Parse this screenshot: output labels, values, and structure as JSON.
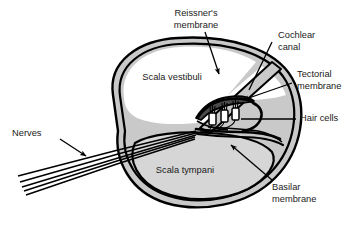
{
  "figure": {
    "width": 362,
    "height": 228,
    "background": "#ffffff"
  },
  "colors": {
    "outline": "#000000",
    "wall_fill": "#c9c9c9",
    "scala_tympani_fill": "#d6d6d6",
    "scala_vestibuli_fill": "#ffffff",
    "cochlear_canal_fill": "#ffffff",
    "text": "#1a1a1a",
    "organ_shading": "#8f8f8f"
  },
  "labels": {
    "reissners_membrane": {
      "line1": "Reissner's",
      "line2": "membrane",
      "x": 196,
      "y1": 14,
      "y2": 26,
      "anchor": "middle"
    },
    "cochlear_canal": {
      "line1": "Cochlear",
      "line2": "canal",
      "x": 278,
      "y1": 36,
      "y2": 48,
      "anchor": "start"
    },
    "tectorial_membrane": {
      "line1": "Tectorial",
      "line2": "membrane",
      "x": 297,
      "y1": 75,
      "y2": 87,
      "anchor": "start"
    },
    "hair_cells": {
      "line1": "Hair cells",
      "x": 300,
      "y1": 119,
      "anchor": "start"
    },
    "basilar_membrane": {
      "line1": "Basilar",
      "line2": "membrane",
      "x": 272,
      "y1": 188,
      "y2": 200,
      "anchor": "start"
    },
    "nerves": {
      "line1": "Nerves",
      "x": 12,
      "y1": 134,
      "anchor": "start"
    },
    "scala_vestibuli": {
      "line1": "Scala vestibuli",
      "x": 172,
      "y1": 78,
      "anchor": "middle"
    },
    "scala_tympani": {
      "line1": "Scala tympani",
      "x": 185,
      "y1": 171,
      "anchor": "middle"
    }
  },
  "leaders": {
    "reissners_membrane": {
      "from": [
        205,
        32
      ],
      "to": [
        219,
        74
      ],
      "arrow": true
    },
    "cochlear_canal": {
      "from": [
        272,
        40
      ],
      "to": [
        248,
        90
      ],
      "arrow": false
    },
    "tectorial_membrane": {
      "from": [
        292,
        83
      ],
      "to": [
        240,
        101
      ],
      "arrow": true
    },
    "hair_cells": {
      "from": [
        297,
        119
      ],
      "to": [
        240,
        119
      ],
      "arrow": false
    },
    "basilar_membrane": {
      "from": [
        272,
        180
      ],
      "to": [
        229,
        144
      ],
      "arrow": true
    },
    "nerves": {
      "from": [
        62,
        138
      ],
      "to": [
        88,
        155
      ],
      "arrow": true
    }
  },
  "structures": [
    {
      "name": "scala-vestibuli",
      "description": "Upper fluid chamber, white interior"
    },
    {
      "name": "scala-tympani",
      "description": "Lower fluid chamber, gray interior"
    },
    {
      "name": "cochlear-canal",
      "description": "Triangular scala media between membranes"
    },
    {
      "name": "reissners-membrane",
      "description": "Diagonal band separating scala vestibuli from cochlear canal"
    },
    {
      "name": "basilar-membrane",
      "description": "Band beneath the organ of Corti"
    },
    {
      "name": "tectorial-membrane",
      "description": "Curved flap overlying the hair cells"
    },
    {
      "name": "hair-cells",
      "description": "Three receptor cells with stereocilia"
    },
    {
      "name": "nerve-fibers",
      "description": "Five fibers fanning to the lower left"
    }
  ],
  "counts": {
    "hair_cells": 3,
    "nerve_fibers": 5
  }
}
